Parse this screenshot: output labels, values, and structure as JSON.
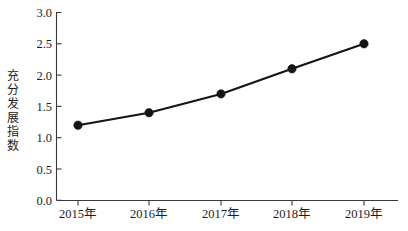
{
  "chart_data": {
    "type": "line",
    "title": "",
    "subtitle": "",
    "xlabel": "",
    "ylabel": "充分发展指数",
    "categories": [
      "2015年",
      "2016年",
      "2017年",
      "2018年",
      "2019年"
    ],
    "values": [
      1.2,
      1.4,
      1.7,
      2.1,
      2.5
    ],
    "series": [
      {
        "name": "充分发展指数",
        "values": [
          1.2,
          1.4,
          1.7,
          2.1,
          2.5
        ]
      }
    ],
    "ylim": [
      0.0,
      3.0
    ],
    "ytick_values": [
      0.0,
      0.5,
      1.0,
      1.5,
      2.0,
      2.5,
      3.0
    ],
    "ytick_labels": [
      "0.0",
      "0.5",
      "1.0",
      "1.5",
      "2.0",
      "2.5",
      "3.0"
    ],
    "xtick_labels": [
      "2015年",
      "2016年",
      "2017年",
      "2018年",
      "2019年"
    ],
    "grid": false,
    "legend": false,
    "legend_position": "none",
    "marker": "circle",
    "line_color": "#141414",
    "marker_color": "#141414",
    "axis_color": "#3a3a3a",
    "background_color": "#ffffff",
    "annotations": []
  },
  "ylabel_chars": [
    "充",
    "分",
    "发",
    "展",
    "指",
    "数"
  ]
}
